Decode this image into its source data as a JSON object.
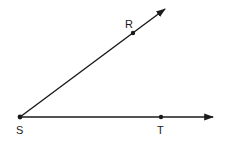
{
  "diagram": {
    "type": "angle",
    "vertex": {
      "label": "S",
      "x": 20,
      "y": 117
    },
    "rays": [
      {
        "name": "ray-SR",
        "through": {
          "label": "R",
          "x": 133,
          "y": 33
        },
        "tip": {
          "x": 166,
          "y": 8
        }
      },
      {
        "name": "ray-ST",
        "through": {
          "label": "T",
          "x": 161,
          "y": 117
        },
        "tip": {
          "x": 214,
          "y": 117
        }
      }
    ],
    "labels": {
      "S": "S",
      "R": "R",
      "T": "T"
    },
    "colors": {
      "stroke": "#1a1a1a",
      "background": "#ffffff"
    }
  }
}
